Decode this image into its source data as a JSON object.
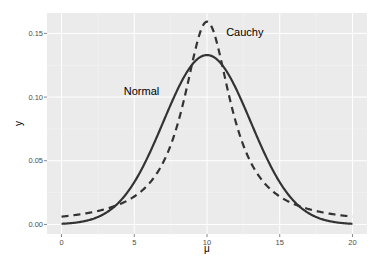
{
  "chart_data": {
    "type": "line",
    "title": "",
    "xlabel": "μ",
    "ylabel": "y",
    "xlim": [
      -1,
      21
    ],
    "ylim": [
      -0.0075,
      0.166
    ],
    "x_ticks": [
      0,
      5,
      10,
      15,
      20
    ],
    "x_tick_labels": [
      "0",
      "5",
      "10",
      "15",
      "20"
    ],
    "y_ticks": [
      0.0,
      0.05,
      0.1,
      0.15
    ],
    "y_tick_labels": [
      "0.00",
      "0.05",
      "0.10",
      "0.15"
    ],
    "grid": true,
    "legend": "none",
    "series": [
      {
        "name": "Normal",
        "distribution": "normal",
        "params": {
          "mean": 10,
          "sd": 3
        },
        "linestyle": "solid",
        "color": "#333333",
        "x": [
          0,
          1,
          2,
          3,
          4,
          5,
          6,
          7,
          8,
          9,
          10,
          11,
          12,
          13,
          14,
          15,
          16,
          17,
          18,
          19,
          20
        ],
        "values": [
          0.0005,
          0.0015,
          0.0038,
          0.0087,
          0.018,
          0.0332,
          0.0547,
          0.0807,
          0.1065,
          0.1258,
          0.133,
          0.1258,
          0.1065,
          0.0807,
          0.0547,
          0.0332,
          0.018,
          0.0087,
          0.0038,
          0.0015,
          0.0005
        ]
      },
      {
        "name": "Cauchy",
        "distribution": "cauchy",
        "params": {
          "location": 10,
          "scale": 2
        },
        "linestyle": "dashed",
        "color": "#333333",
        "x": [
          0,
          1,
          2,
          3,
          4,
          5,
          6,
          7,
          8,
          9,
          10,
          11,
          12,
          13,
          14,
          15,
          16,
          17,
          18,
          19,
          20
        ],
        "values": [
          0.0061,
          0.0075,
          0.0094,
          0.012,
          0.0159,
          0.022,
          0.0318,
          0.049,
          0.0796,
          0.1273,
          0.1592,
          0.1273,
          0.0796,
          0.049,
          0.0318,
          0.022,
          0.0159,
          0.012,
          0.0094,
          0.0075,
          0.0061
        ]
      }
    ],
    "annotations": [
      {
        "text": "Normal",
        "x": 5.5,
        "y": 0.102
      },
      {
        "text": "Cauchy",
        "x": 12.6,
        "y": 0.148
      }
    ]
  }
}
